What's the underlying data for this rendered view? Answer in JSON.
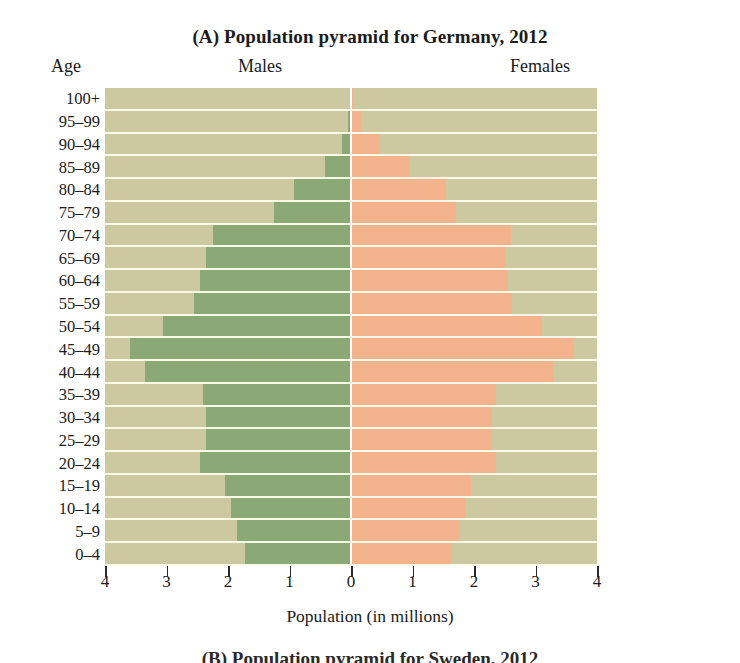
{
  "figure": {
    "panel_letter": "(A)",
    "title": "(A) Population pyramid for Germany, 2012",
    "title_text": "Population pyramid for Germany, 2012",
    "next_panel_caption": "(B) Population pyramid for Sweden, 2012"
  },
  "headers": {
    "age": "Age",
    "males": "Males",
    "females": "Females"
  },
  "axis": {
    "x_title": "Population (in millions)",
    "x_ticklabels": [
      "4",
      "3",
      "2",
      "1",
      "0",
      "1",
      "2",
      "3",
      "4"
    ],
    "x_tickvalues": [
      -4,
      -3,
      -2,
      -1,
      0,
      1,
      2,
      3,
      4
    ]
  },
  "colors": {
    "male_bar": "#8ba877",
    "female_bar": "#f3b48d",
    "plot_background": "#ccc9a0",
    "gridline": "#fbfae8",
    "center_axis": "#ffffff",
    "text": "#1b1b1b"
  },
  "chart_data": {
    "type": "bar",
    "subtype": "population-pyramid",
    "title": "(A) Population pyramid for Germany, 2012",
    "xlabel": "Population (in millions)",
    "ylabel": "Age",
    "xlim": [
      -4,
      4
    ],
    "xlim_display": [
      4,
      0,
      4
    ],
    "grid": true,
    "legend_position": "top-inline",
    "units": "millions",
    "categories": [
      "100+",
      "95–99",
      "90–94",
      "85–89",
      "80–84",
      "75–79",
      "70–74",
      "65–69",
      "60–64",
      "55–59",
      "50–54",
      "45–49",
      "40–44",
      "35–39",
      "30–34",
      "25–29",
      "20–24",
      "15–19",
      "10–14",
      "5–9",
      "0–4"
    ],
    "series": [
      {
        "name": "Males",
        "side": "left",
        "color": "#8ba877",
        "values": [
          0.01,
          0.05,
          0.15,
          0.42,
          0.92,
          1.25,
          2.25,
          2.35,
          2.45,
          2.55,
          3.05,
          3.6,
          3.35,
          2.4,
          2.35,
          2.35,
          2.45,
          2.05,
          1.95,
          1.85,
          1.72
        ]
      },
      {
        "name": "Females",
        "side": "right",
        "color": "#f3b48d",
        "values": [
          0.04,
          0.16,
          0.45,
          0.95,
          1.55,
          1.7,
          2.6,
          2.5,
          2.55,
          2.62,
          3.1,
          3.62,
          3.28,
          2.35,
          2.3,
          2.28,
          2.35,
          1.95,
          1.85,
          1.75,
          1.63
        ]
      }
    ]
  }
}
